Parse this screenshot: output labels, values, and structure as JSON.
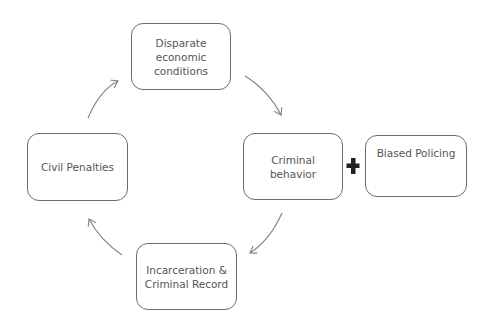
{
  "diagram": {
    "type": "cycle",
    "nodes": [
      {
        "id": "disparate",
        "label": "Disparate economic conditions",
        "lines": [
          "Disparate",
          "economic",
          "conditions"
        ]
      },
      {
        "id": "criminal",
        "label": "Criminal behavior",
        "lines": [
          "Criminal",
          "behavior"
        ]
      },
      {
        "id": "biased",
        "label": "Biased Policing",
        "lines": [
          "Biased Policing"
        ]
      },
      {
        "id": "incarceration",
        "label": "Incarceration & Criminal Record",
        "lines": [
          "Incarceration &",
          "Criminal Record"
        ]
      },
      {
        "id": "civil",
        "label": "Civil Penalties",
        "lines": [
          "Civil Penalties"
        ]
      }
    ],
    "connector_symbol": "plus",
    "edges": [
      {
        "from": "disparate",
        "to": "criminal"
      },
      {
        "from": "criminal",
        "to": "incarceration"
      },
      {
        "from": "incarceration",
        "to": "civil"
      },
      {
        "from": "civil",
        "to": "disparate"
      }
    ],
    "colors": {
      "border": "#6b6b6b",
      "text": "#555555",
      "arrow": "#808080",
      "plus": "#222222"
    }
  }
}
